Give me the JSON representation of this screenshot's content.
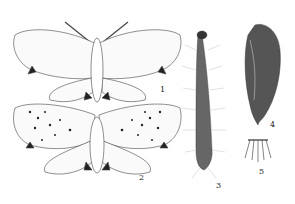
{
  "figure": {
    "labels": [
      {
        "id": "1",
        "text": "1",
        "subject": "adult moth (upper, wings spread)",
        "x": 160,
        "y": 90
      },
      {
        "id": "2",
        "text": "2",
        "subject": "adult moth (lower, spotted wings)",
        "x": 139,
        "y": 178
      },
      {
        "id": "3",
        "text": "3",
        "subject": "hairy larva (caterpillar)",
        "x": 216,
        "y": 186
      },
      {
        "id": "4",
        "text": "4",
        "subject": "pupa",
        "x": 270,
        "y": 125
      },
      {
        "id": "5",
        "text": "5",
        "subject": "cremaster / pupa tip detail",
        "x": 259,
        "y": 172
      }
    ],
    "colors": {
      "ink": "#222222",
      "background": "#ffffff"
    }
  }
}
